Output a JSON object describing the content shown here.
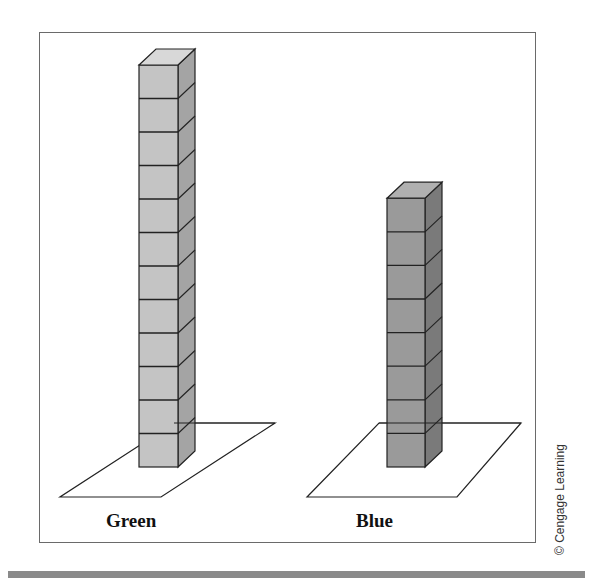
{
  "figure": {
    "towers": [
      {
        "label": "Green",
        "cube_count": 12,
        "front_color": "#c4c4c4",
        "side_color": "#a4a4a4",
        "top_color": "#d8d8d8"
      },
      {
        "label": "Blue",
        "cube_count": 8,
        "front_color": "#9a9a9a",
        "side_color": "#7a7a7a",
        "top_color": "#b0b0b0"
      }
    ],
    "credit": "© Cengage Learning"
  }
}
